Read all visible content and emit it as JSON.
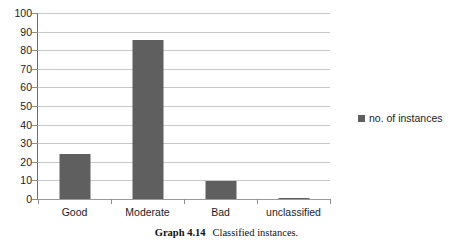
{
  "chart_data": {
    "type": "bar",
    "title": "",
    "xlabel": "",
    "ylabel": "",
    "categories": [
      "Good",
      "Moderate",
      "Bad",
      "unclassified"
    ],
    "values": [
      24,
      85.5,
      9.5,
      0.5
    ],
    "series": [
      {
        "name": "no. of instances",
        "values": [
          24,
          85.5,
          9.5,
          0.5
        ],
        "color": "#5f5f5f"
      }
    ],
    "ylim": [
      0,
      100
    ],
    "ytick_step": 10,
    "yticks": [
      100,
      90,
      80,
      70,
      60,
      50,
      40,
      30,
      20,
      10,
      0
    ],
    "grid": true,
    "grid_axis": "y",
    "legend_position": "right",
    "bar_color": "#5f5f5f",
    "gridline_color": "#c8c8c8",
    "axis_color": "#6e6e6e"
  },
  "legend": {
    "entries": [
      {
        "label": "no. of instances",
        "marker": "square",
        "color": "#5f5f5f"
      }
    ]
  },
  "caption": {
    "number": "Graph 4.14",
    "text": "Classified instances."
  }
}
